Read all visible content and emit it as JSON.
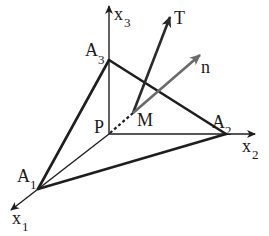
{
  "diagram": {
    "type": "tetrahedron-stress-vector",
    "colors": {
      "line": "#1e1e1e",
      "normal_vector": "#6a6a6a",
      "background": "#ffffff"
    },
    "axes": {
      "x1": {
        "letter": "x",
        "sub": "1"
      },
      "x2": {
        "letter": "x",
        "sub": "2"
      },
      "x3": {
        "letter": "x",
        "sub": "3"
      }
    },
    "points": {
      "P": {
        "label": "P"
      },
      "M": {
        "label": "M"
      },
      "A1": {
        "letter": "A",
        "sub": "1"
      },
      "A2": {
        "letter": "A",
        "sub": "2"
      },
      "A3": {
        "letter": "A",
        "sub": "3"
      }
    },
    "vectors": {
      "T": {
        "label": "T"
      },
      "n": {
        "label": "n"
      }
    }
  }
}
